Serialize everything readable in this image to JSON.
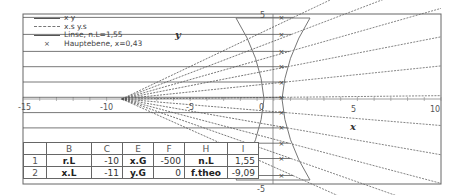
{
  "chart_data": {
    "type": "line",
    "title": "",
    "xlabel": "x",
    "ylabel": "y",
    "xlim": [
      -15,
      10
    ],
    "ylim": [
      -5,
      5
    ],
    "x_ticks": [
      -15,
      -10,
      -5,
      0,
      5,
      10
    ],
    "x_tick_labels": [
      "-15",
      "-10",
      "-5",
      "0",
      "5",
      "10"
    ],
    "y_ticks": [
      5,
      0,
      -5
    ],
    "y_tick_labels": [
      "5",
      "0",
      "-5"
    ],
    "grid": false,
    "legend_position": "upper-left",
    "legend": [
      {
        "label": "x y",
        "style": "solid"
      },
      {
        "label": "x.s y.s",
        "style": "dashed"
      },
      {
        "label": "Linse, n.L=1,55",
        "style": "solid"
      },
      {
        "label": "Hauptebene, x=0,43",
        "style": "marker-x"
      }
    ],
    "series": [
      {
        "name": "x y",
        "description": "incoming parallel rays from x=-15 to lens front surface",
        "y_values": [
          4.8,
          3.8,
          2.8,
          1.9,
          1.0,
          0.1,
          -0.8,
          -1.7,
          -2.6,
          -3.5,
          -4.5
        ]
      },
      {
        "name": "x.s y.s",
        "description": "virtual ray extensions converging at focal point x=-9.09 and diverging rays behind lens",
        "focus_x": -9.09
      },
      {
        "name": "Linse, n.L=1,55",
        "description": "biconcave lens outline, vertical extent -4.8 to 4.8, outer x approx -2.5 to 2.5, center thickness ~2.3"
      },
      {
        "name": "Hauptebene, x=0,43",
        "x": 0.43,
        "marker": "x"
      }
    ]
  },
  "legend": {
    "items": [
      "x y",
      "x.s y.s",
      "Linse, n.L=1,55",
      "Hauptebene, x=0,43"
    ]
  },
  "axes": {
    "x_title": "x",
    "y_title": "y",
    "x_labels": [
      "-15",
      "-10",
      "-5",
      "0",
      "5",
      "10"
    ],
    "y_labels": [
      "5",
      "0",
      "-5"
    ]
  },
  "sheet": {
    "columns": [
      "",
      "B",
      "C",
      "E",
      "F",
      "H",
      "I"
    ],
    "rows": [
      {
        "row": "1",
        "cells": [
          "r.L",
          "-10",
          "x.G",
          "-500",
          "n.L",
          "1,55"
        ]
      },
      {
        "row": "2",
        "cells": [
          "x.L",
          "-11",
          "y.G",
          "0",
          "f.theo",
          "-9,09"
        ]
      }
    ]
  },
  "colors": {
    "frame": "#666666",
    "ray": "#555555",
    "dashed": "#777777",
    "lens": "#777777"
  }
}
